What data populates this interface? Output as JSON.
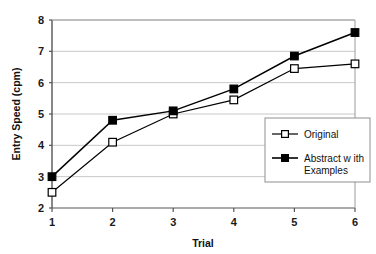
{
  "chart_data": {
    "type": "line",
    "title": "",
    "xlabel": "Trial",
    "ylabel": "Entry Speed (cpm)",
    "x": [
      1,
      2,
      3,
      4,
      5,
      6
    ],
    "categories": [
      "1",
      "2",
      "3",
      "4",
      "5",
      "6"
    ],
    "xtick_labels": [
      "1",
      "2",
      "3",
      "4",
      "5",
      "6"
    ],
    "ytick_labels": [
      "2",
      "3",
      "4",
      "5",
      "6",
      "7",
      "8"
    ],
    "ylim": [
      2,
      8
    ],
    "xlim": [
      1,
      6
    ],
    "grid": "horizontal",
    "legend_position": "inside-lower-right",
    "series": [
      {
        "name": "Original",
        "marker": "open-square",
        "values": [
          2.5,
          4.1,
          5.0,
          5.45,
          6.45,
          6.6
        ]
      },
      {
        "name": "Abstract with Examples",
        "marker": "filled-square",
        "values": [
          3.0,
          4.8,
          5.1,
          5.8,
          6.85,
          7.6
        ]
      }
    ],
    "legend_entries": [
      {
        "label": "Original",
        "marker": "open-square"
      },
      {
        "label": "Abstract w ith",
        "label_line2": "Examples",
        "marker": "filled-square"
      }
    ],
    "colors": {
      "line": "#000000",
      "grid": "#c8c8c8",
      "axis": "#555555",
      "text": "#111111",
      "background": "#ffffff"
    }
  }
}
